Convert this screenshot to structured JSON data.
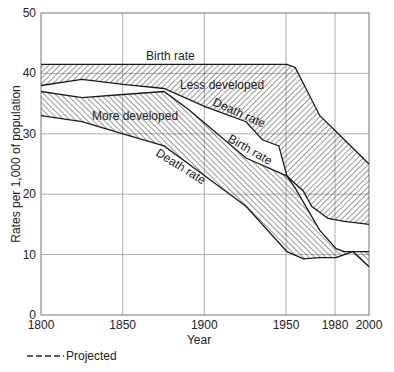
{
  "chart_data": {
    "type": "area",
    "title": "",
    "xlabel": "Year",
    "ylabel": "Rates per 1,000 of population",
    "xlim": [
      1800,
      2000
    ],
    "ylim": [
      0,
      50
    ],
    "x_ticks": [
      1800,
      1850,
      1900,
      1950,
      1980,
      2000
    ],
    "y_ticks": [
      0,
      10,
      20,
      30,
      40,
      50
    ],
    "grid": true,
    "legend": [
      {
        "label": "Projected",
        "style": "dashed"
      }
    ],
    "legend_position": "bottom-left",
    "series": [
      {
        "name": "Less developed - Birth rate",
        "x": [
          1800,
          1950,
          1955,
          1970,
          1985,
          2000
        ],
        "values": [
          41.5,
          41.5,
          41,
          33,
          29,
          25
        ]
      },
      {
        "name": "Less developed - Death rate",
        "x": [
          1800,
          1825,
          1850,
          1875,
          1900,
          1925,
          1935,
          1945,
          1950,
          1960,
          1965,
          1975,
          1985,
          2000
        ],
        "values": [
          38,
          39,
          38.2,
          37.5,
          34.5,
          32,
          29,
          28,
          23,
          20.5,
          18,
          16,
          15.5,
          15
        ]
      },
      {
        "name": "More developed - Birth rate",
        "x": [
          1800,
          1825,
          1850,
          1875,
          1890,
          1925,
          1950,
          1955,
          1970,
          1980,
          1985,
          2000
        ],
        "values": [
          37,
          36,
          36.5,
          37,
          34,
          26,
          23,
          21,
          14,
          11,
          10.5,
          10.5
        ]
      },
      {
        "name": "More developed - Death rate",
        "x": [
          1800,
          1825,
          1850,
          1875,
          1900,
          1925,
          1950,
          1960,
          1970,
          1980,
          1990,
          2000
        ],
        "values": [
          33,
          32,
          30,
          28,
          23,
          18,
          10.5,
          9.3,
          9.5,
          9.5,
          10.5,
          8
        ]
      }
    ],
    "annotations": [
      {
        "text": "Birth rate",
        "near": "Less developed birth rate, ~1850"
      },
      {
        "text": "Less developed",
        "near": "~1890, 37"
      },
      {
        "text": "Death rate",
        "near": "Less developed death rate, ~1920"
      },
      {
        "text": "More developed",
        "near": "~1850, 33"
      },
      {
        "text": "Birth rate",
        "near": "More developed birth rate, ~1925"
      },
      {
        "text": "Death rate",
        "near": "More developed death rate, ~1885"
      }
    ]
  },
  "labels": {
    "x_axis": "Year",
    "y_axis": "Rates per 1,000 of population",
    "x_ticks": [
      "1800",
      "1850",
      "1900",
      "1950",
      "1980",
      "2000"
    ],
    "y_ticks": [
      "0",
      "10",
      "20",
      "30",
      "40",
      "50"
    ],
    "legend_projected": "Projected",
    "annot_birth_rate_less": "Birth rate",
    "annot_less_developed": "Less developed",
    "annot_death_rate_less": "Death rate",
    "annot_more_developed": "More developed",
    "annot_birth_rate_more": "Birth rate",
    "annot_death_rate_more": "Death rate"
  }
}
